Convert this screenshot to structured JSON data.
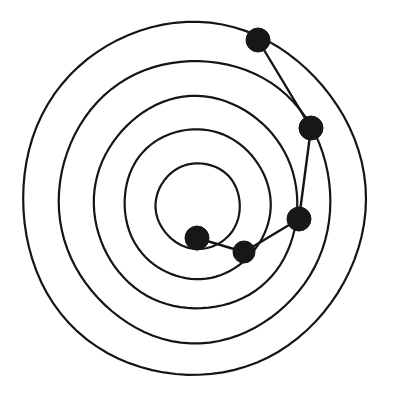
{
  "figure": {
    "background_color": "#ffffff",
    "stroke_color": "#151515",
    "node_color": "#171717",
    "width": 394,
    "height": 404
  },
  "chart_data": {
    "type": "scatter",
    "subtitle": "",
    "xlabel": "",
    "ylabel": "",
    "grid": false,
    "legend": false,
    "axis_visible": false,
    "center": {
      "x": 193,
      "y": 199
    },
    "rings": [
      {
        "name": "ring-1-outer",
        "rx": 171,
        "ry": 177,
        "cx": 193,
        "cy": 199,
        "rotation": -4
      },
      {
        "name": "ring-2",
        "rx": 136,
        "ry": 141,
        "cx": 195,
        "cy": 201,
        "rotation": -4
      },
      {
        "name": "ring-3",
        "rx": 102,
        "ry": 106,
        "cx": 196,
        "cy": 203,
        "rotation": -5
      },
      {
        "name": "ring-4",
        "rx": 73,
        "ry": 75,
        "cx": 197,
        "cy": 204,
        "rotation": -5
      },
      {
        "name": "ring-5-inner",
        "rx": 42,
        "ry": 43,
        "cx": 198,
        "cy": 206,
        "rotation": -5
      }
    ],
    "nodes": [
      {
        "id": "node-1",
        "label": "",
        "x": 258,
        "y": 40,
        "r": 12,
        "ring": "ring-1-outer"
      },
      {
        "id": "node-2",
        "label": "",
        "x": 311,
        "y": 128,
        "r": 12,
        "ring": "ring-2"
      },
      {
        "id": "node-3",
        "label": "",
        "x": 299,
        "y": 219,
        "r": 12,
        "ring": "ring-3"
      },
      {
        "id": "node-4",
        "label": "",
        "x": 244,
        "y": 252,
        "r": 11,
        "ring": "ring-4"
      },
      {
        "id": "node-5",
        "label": "",
        "x": 197,
        "y": 238,
        "r": 12,
        "ring": "ring-5-inner"
      }
    ],
    "edges": [
      {
        "from": "node-1",
        "to": "node-2"
      },
      {
        "from": "node-2",
        "to": "node-3"
      },
      {
        "from": "node-3",
        "to": "node-4"
      },
      {
        "from": "node-4",
        "to": "node-5"
      }
    ],
    "values": [],
    "categories": []
  }
}
